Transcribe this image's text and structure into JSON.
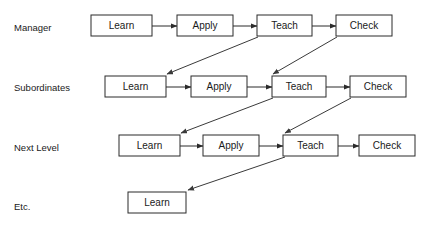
{
  "diagram": {
    "background_color": "#ffffff",
    "line_color": "#2b2b2b",
    "text_color": "#1a1a1a",
    "box_fill": "#ffffff",
    "rows": [
      {
        "label": "Manager",
        "label_x": 14,
        "label_y": 28,
        "box_y": 15,
        "box_h": 21,
        "nodes": [
          {
            "text": "Learn",
            "x": 91,
            "w": 61
          },
          {
            "text": "Apply",
            "x": 177,
            "w": 56
          },
          {
            "text": "Teach",
            "x": 257,
            "w": 55
          },
          {
            "text": "Check",
            "x": 336,
            "w": 56
          }
        ]
      },
      {
        "label": "Subordinates",
        "label_x": 14,
        "label_y": 88,
        "box_y": 76,
        "box_h": 21,
        "nodes": [
          {
            "text": "Learn",
            "x": 105,
            "w": 61
          },
          {
            "text": "Apply",
            "x": 191,
            "w": 56
          },
          {
            "text": "Teach",
            "x": 272,
            "w": 54
          },
          {
            "text": "Check",
            "x": 350,
            "w": 56
          }
        ]
      },
      {
        "label": "Next Level",
        "label_x": 14,
        "label_y": 148,
        "box_y": 135,
        "box_h": 21,
        "nodes": [
          {
            "text": "Learn",
            "x": 119,
            "w": 61
          },
          {
            "text": "Apply",
            "x": 203,
            "w": 56
          },
          {
            "text": "Teach",
            "x": 283,
            "w": 55
          },
          {
            "text": "Check",
            "x": 359,
            "w": 56
          }
        ]
      },
      {
        "label": "Etc.",
        "label_x": 14,
        "label_y": 207,
        "box_y": 192,
        "box_h": 21,
        "nodes": [
          {
            "text": "Learn",
            "x": 128,
            "w": 58
          }
        ]
      }
    ],
    "horizontal_arrows": [
      {
        "from": "Manager.Learn",
        "to": "Manager.Apply",
        "x1": 152,
        "y1": 26,
        "x2": 177,
        "y2": 26
      },
      {
        "from": "Manager.Apply",
        "to": "Manager.Teach",
        "x1": 233,
        "y1": 26,
        "x2": 257,
        "y2": 26
      },
      {
        "from": "Manager.Teach",
        "to": "Manager.Check",
        "x1": 312,
        "y1": 26,
        "x2": 336,
        "y2": 26
      },
      {
        "from": "Subordinates.Learn",
        "to": "Subordinates.Apply",
        "x1": 166,
        "y1": 87,
        "x2": 191,
        "y2": 87
      },
      {
        "from": "Subordinates.Apply",
        "to": "Subordinates.Teach",
        "x1": 247,
        "y1": 87,
        "x2": 272,
        "y2": 87
      },
      {
        "from": "Subordinates.Teach",
        "to": "Subordinates.Check",
        "x1": 326,
        "y1": 87,
        "x2": 350,
        "y2": 87
      },
      {
        "from": "NextLevel.Learn",
        "to": "NextLevel.Apply",
        "x1": 180,
        "y1": 146,
        "x2": 203,
        "y2": 146
      },
      {
        "from": "NextLevel.Apply",
        "to": "NextLevel.Teach",
        "x1": 259,
        "y1": 146,
        "x2": 283,
        "y2": 146
      },
      {
        "from": "NextLevel.Teach",
        "to": "NextLevel.Check",
        "x1": 338,
        "y1": 146,
        "x2": 359,
        "y2": 146
      }
    ],
    "diagonal_arrows": [
      {
        "from": "Manager.Teach",
        "to": "Subordinates.Learn",
        "x1": 258,
        "y1": 37,
        "x2": 167,
        "y2": 74
      },
      {
        "from": "Manager.Check",
        "to": "Subordinates.Teach",
        "x1": 337,
        "y1": 37,
        "x2": 273,
        "y2": 74
      },
      {
        "from": "Subordinates.Teach",
        "to": "NextLevel.Learn",
        "x1": 273,
        "y1": 98,
        "x2": 181,
        "y2": 133
      },
      {
        "from": "Subordinates.Check",
        "to": "NextLevel.Teach",
        "x1": 351,
        "y1": 98,
        "x2": 285,
        "y2": 133
      },
      {
        "from": "NextLevel.Teach",
        "to": "Etc.Learn",
        "x1": 285,
        "y1": 157,
        "x2": 188,
        "y2": 190
      }
    ]
  }
}
